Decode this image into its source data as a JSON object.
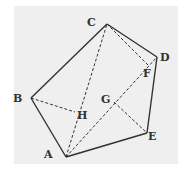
{
  "diagram": {
    "type": "geometry-pentagon",
    "background_color": "#efefef",
    "stroke_color": "#333333",
    "points": {
      "A": {
        "x": 66,
        "y": 157,
        "label": "A",
        "lx": 44,
        "ly": 158
      },
      "B": {
        "x": 31,
        "y": 98,
        "label": "B",
        "lx": 13,
        "ly": 102
      },
      "C": {
        "x": 107,
        "y": 24,
        "label": "C",
        "lx": 87,
        "ly": 26
      },
      "D": {
        "x": 157,
        "y": 57,
        "label": "D",
        "lx": 160,
        "ly": 61
      },
      "E": {
        "x": 147,
        "y": 133,
        "label": "E",
        "lx": 148,
        "ly": 140
      },
      "F": {
        "x": 148,
        "y": 65,
        "label": "F",
        "lx": 143,
        "ly": 77
      },
      "G": {
        "x": 114,
        "y": 102,
        "label": "G",
        "lx": 101,
        "ly": 103
      },
      "H": {
        "x": 75,
        "y": 112,
        "label": "H",
        "lx": 77,
        "ly": 119
      }
    },
    "solid_edges": [
      [
        "A",
        "B"
      ],
      [
        "B",
        "C"
      ],
      [
        "C",
        "D"
      ],
      [
        "D",
        "E"
      ],
      [
        "E",
        "A"
      ]
    ],
    "dashed_segments": [
      [
        "A",
        "C"
      ],
      [
        "A",
        "D"
      ],
      [
        "C",
        "F"
      ],
      [
        "B",
        "H"
      ],
      [
        "G",
        "E"
      ]
    ]
  }
}
